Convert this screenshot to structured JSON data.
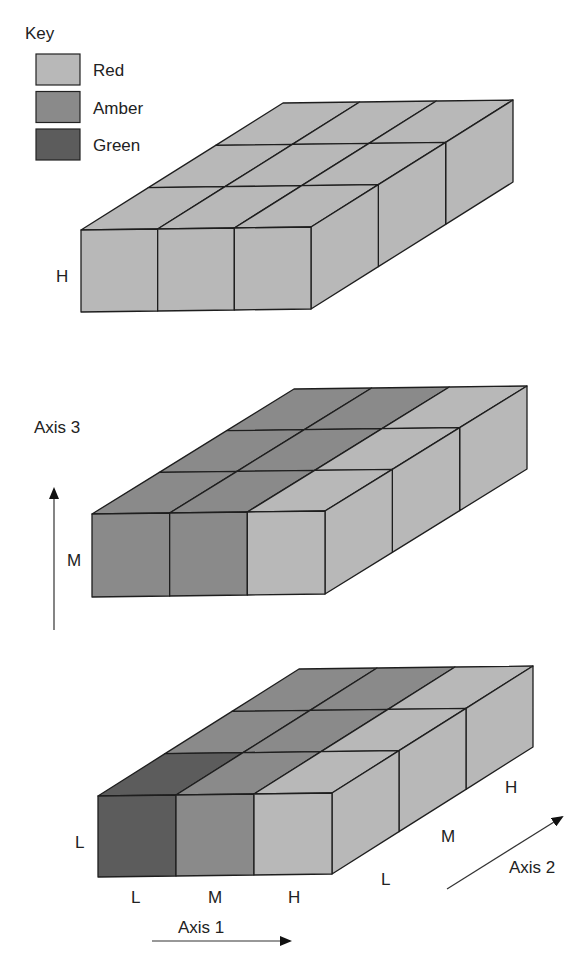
{
  "legend": {
    "title": "Key",
    "items": [
      {
        "label": "Red",
        "color": "#b8b8b8"
      },
      {
        "label": "Amber",
        "color": "#8a8a8a"
      },
      {
        "label": "Green",
        "color": "#5c5c5c"
      }
    ]
  },
  "axes": {
    "axis1": {
      "label": "Axis 1",
      "ticks": [
        "L",
        "M",
        "H"
      ]
    },
    "axis2": {
      "label": "Axis 2",
      "ticks": [
        "L",
        "M",
        "H"
      ]
    },
    "axis3": {
      "label": "Axis 3",
      "ticks": [
        "L",
        "M",
        "H"
      ]
    }
  },
  "chart_data": {
    "type": "heatmap",
    "title": "",
    "legend": [
      "Red",
      "Amber",
      "Green"
    ],
    "axis1_levels": [
      "L",
      "M",
      "H"
    ],
    "axis2_levels": [
      "L",
      "M",
      "H"
    ],
    "slabs": [
      {
        "axis3": "H",
        "grid_rows_axis2": {
          "L": [
            "Red",
            "Red",
            "Red"
          ],
          "M": [
            "Red",
            "Red",
            "Red"
          ],
          "H": [
            "Red",
            "Red",
            "Red"
          ]
        }
      },
      {
        "axis3": "M",
        "grid_rows_axis2": {
          "L": [
            "Amber",
            "Amber",
            "Red"
          ],
          "M": [
            "Amber",
            "Amber",
            "Red"
          ],
          "H": [
            "Amber",
            "Amber",
            "Red"
          ]
        }
      },
      {
        "axis3": "L",
        "grid_rows_axis2": {
          "L": [
            "Green",
            "Amber",
            "Red"
          ],
          "M": [
            "Amber",
            "Amber",
            "Red"
          ],
          "H": [
            "Amber",
            "Amber",
            "Red"
          ]
        }
      }
    ]
  }
}
